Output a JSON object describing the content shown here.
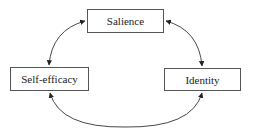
{
  "diagram": {
    "type": "concept-relationship",
    "nodes": [
      {
        "id": "salience",
        "label": "Salience"
      },
      {
        "id": "self_efficacy",
        "label": "Self-efficacy"
      },
      {
        "id": "identity",
        "label": "Identity"
      }
    ],
    "edges": [
      {
        "from": "salience",
        "to": "self_efficacy",
        "direction": "bidirectional",
        "style": "curved"
      },
      {
        "from": "salience",
        "to": "identity",
        "direction": "bidirectional",
        "style": "curved"
      },
      {
        "from": "self_efficacy",
        "to": "identity",
        "direction": "bidirectional",
        "style": "curved"
      }
    ],
    "colors": {
      "line": "#333333",
      "box_border": "#555555",
      "text": "#222222",
      "background": "#ffffff"
    }
  }
}
